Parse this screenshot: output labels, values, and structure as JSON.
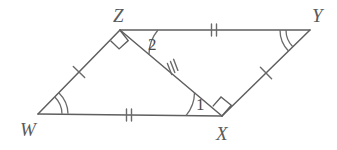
{
  "figure": {
    "type": "geometry-diagram",
    "shape": "parallelogram-with-diagonal",
    "background_color": "#ffffff",
    "line_color": "#5f5f5f",
    "label_color": "#5a5a5a",
    "vertices": [
      {
        "name": "W",
        "label": "W",
        "x": 38,
        "y": 114,
        "label_x": 20,
        "label_y": 136
      },
      {
        "name": "Z",
        "label": "Z",
        "x": 120,
        "y": 30,
        "label_x": 113,
        "label_y": 22
      },
      {
        "name": "Y",
        "label": "Y",
        "x": 310,
        "y": 30,
        "label_x": 312,
        "label_y": 22
      },
      {
        "name": "X",
        "label": "X",
        "x": 222,
        "y": 116,
        "label_x": 216,
        "label_y": 140
      }
    ],
    "segments": [
      {
        "name": "WZ",
        "from": "W",
        "to": "Z",
        "ticks": 1
      },
      {
        "name": "ZY",
        "from": "Z",
        "to": "Y",
        "ticks": 2
      },
      {
        "name": "YX",
        "from": "Y",
        "to": "X",
        "ticks": 1
      },
      {
        "name": "XW",
        "from": "X",
        "to": "W",
        "ticks": 2
      },
      {
        "name": "ZX",
        "from": "Z",
        "to": "X",
        "ticks": 3
      }
    ],
    "angle_labels": [
      {
        "name": "angle-2",
        "text": "2",
        "at_vertex": "Z",
        "x": 148,
        "y": 50
      },
      {
        "name": "angle-1",
        "text": "1",
        "at_vertex": "X",
        "x": 196,
        "y": 110
      }
    ],
    "right_angles": [
      {
        "name": "right-angle-WZX",
        "at_vertex": "Z",
        "between": [
          "ZW",
          "ZX"
        ]
      },
      {
        "name": "right-angle-ZXY",
        "at_vertex": "X",
        "between": [
          "XZ",
          "XY"
        ]
      }
    ],
    "angle_arcs": [
      {
        "name": "angle-arc-W",
        "at_vertex": "W",
        "count": 2
      },
      {
        "name": "angle-arc-Y",
        "at_vertex": "Y",
        "count": 2
      },
      {
        "name": "angle-arc-Z2",
        "at_vertex": "Z",
        "count": 1
      },
      {
        "name": "angle-arc-X1",
        "at_vertex": "X",
        "count": 1
      }
    ]
  }
}
